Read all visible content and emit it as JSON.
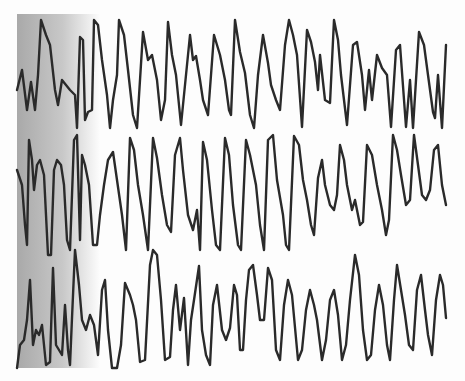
{
  "chart_data": {
    "type": "line",
    "title": "",
    "xlabel": "",
    "ylabel": "",
    "grid": false,
    "legend": "none",
    "shading": {
      "x_start": 17,
      "x_end": 100,
      "color_dark": "#a9a9a9",
      "color_light": "#fdfdfd"
    },
    "trace_color": "#2a2a2a",
    "series": [
      {
        "name": "trace-1",
        "points": [
          [
            17,
            90
          ],
          [
            22,
            70
          ],
          [
            27,
            110
          ],
          [
            31,
            82
          ],
          [
            35,
            110
          ],
          [
            38,
            75
          ],
          [
            41,
            20
          ],
          [
            46,
            35
          ],
          [
            50,
            45
          ],
          [
            55,
            90
          ],
          [
            58,
            105
          ],
          [
            62,
            80
          ],
          [
            66,
            85
          ],
          [
            70,
            90
          ],
          [
            75,
            95
          ],
          [
            77,
            128
          ],
          [
            80,
            37
          ],
          [
            83,
            40
          ],
          [
            85,
            120
          ],
          [
            88,
            112
          ],
          [
            92,
            110
          ],
          [
            94,
            20
          ],
          [
            98,
            25
          ],
          [
            102,
            60
          ],
          [
            107,
            95
          ],
          [
            110,
            128
          ],
          [
            113,
            100
          ],
          [
            117,
            75
          ],
          [
            119,
            20
          ],
          [
            124,
            35
          ],
          [
            128,
            70
          ],
          [
            133,
            115
          ],
          [
            137,
            128
          ],
          [
            143,
            32
          ],
          [
            148,
            60
          ],
          [
            152,
            55
          ],
          [
            157,
            80
          ],
          [
            161,
            120
          ],
          [
            165,
            100
          ],
          [
            168,
            22
          ],
          [
            172,
            55
          ],
          [
            176,
            75
          ],
          [
            181,
            125
          ],
          [
            184,
            95
          ],
          [
            190,
            35
          ],
          [
            193,
            60
          ],
          [
            196,
            56
          ],
          [
            200,
            80
          ],
          [
            203,
            100
          ],
          [
            208,
            115
          ],
          [
            214,
            35
          ],
          [
            220,
            55
          ],
          [
            225,
            80
          ],
          [
            229,
            110
          ],
          [
            231,
            115
          ],
          [
            235,
            20
          ],
          [
            240,
            52
          ],
          [
            245,
            73
          ],
          [
            250,
            115
          ],
          [
            254,
            128
          ],
          [
            258,
            75
          ],
          [
            263,
            35
          ],
          [
            268,
            63
          ],
          [
            271,
            85
          ],
          [
            276,
            100
          ],
          [
            280,
            110
          ],
          [
            285,
            45
          ],
          [
            289,
            20
          ],
          [
            293,
            35
          ],
          [
            297,
            55
          ],
          [
            302,
            127
          ],
          [
            307,
            30
          ],
          [
            311,
            42
          ],
          [
            315,
            62
          ],
          [
            318,
            90
          ],
          [
            320,
            55
          ],
          [
            325,
            100
          ],
          [
            330,
            103
          ],
          [
            334,
            20
          ],
          [
            338,
            40
          ],
          [
            341,
            75
          ],
          [
            344,
            100
          ],
          [
            347,
            125
          ],
          [
            353,
            45
          ],
          [
            357,
            42
          ],
          [
            362,
            75
          ],
          [
            365,
            110
          ],
          [
            369,
            70
          ],
          [
            372,
            100
          ],
          [
            377,
            55
          ],
          [
            382,
            68
          ],
          [
            387,
            75
          ],
          [
            391,
            127
          ],
          [
            396,
            50
          ],
          [
            400,
            45
          ],
          [
            406,
            127
          ],
          [
            410,
            80
          ],
          [
            413,
            128
          ],
          [
            419,
            32
          ],
          [
            424,
            45
          ],
          [
            428,
            75
          ],
          [
            433,
            112
          ],
          [
            435,
            118
          ],
          [
            438,
            75
          ],
          [
            442,
            128
          ],
          [
            446,
            45
          ]
        ]
      },
      {
        "name": "trace-2",
        "points": [
          [
            17,
            170
          ],
          [
            22,
            185
          ],
          [
            25,
            225
          ],
          [
            27,
            245
          ],
          [
            29,
            140
          ],
          [
            32,
            160
          ],
          [
            34,
            190
          ],
          [
            37,
            165
          ],
          [
            40,
            160
          ],
          [
            44,
            175
          ],
          [
            48,
            255
          ],
          [
            51,
            255
          ],
          [
            54,
            170
          ],
          [
            57,
            160
          ],
          [
            61,
            165
          ],
          [
            64,
            185
          ],
          [
            67,
            240
          ],
          [
            70,
            250
          ],
          [
            74,
            140
          ],
          [
            77,
            135
          ],
          [
            80,
            240
          ],
          [
            82,
            155
          ],
          [
            85,
            165
          ],
          [
            89,
            185
          ],
          [
            93,
            245
          ],
          [
            97,
            245
          ],
          [
            100,
            215
          ],
          [
            104,
            185
          ],
          [
            108,
            160
          ],
          [
            113,
            152
          ],
          [
            117,
            180
          ],
          [
            122,
            215
          ],
          [
            126,
            250
          ],
          [
            130,
            138
          ],
          [
            134,
            150
          ],
          [
            138,
            185
          ],
          [
            143,
            215
          ],
          [
            148,
            250
          ],
          [
            153,
            138
          ],
          [
            157,
            158
          ],
          [
            162,
            195
          ],
          [
            167,
            225
          ],
          [
            171,
            232
          ],
          [
            175,
            155
          ],
          [
            180,
            138
          ],
          [
            183,
            170
          ],
          [
            188,
            215
          ],
          [
            193,
            230
          ],
          [
            197,
            210
          ],
          [
            200,
            250
          ],
          [
            203,
            142
          ],
          [
            207,
            160
          ],
          [
            212,
            210
          ],
          [
            216,
            245
          ],
          [
            220,
            250
          ],
          [
            225,
            138
          ],
          [
            229,
            155
          ],
          [
            233,
            205
          ],
          [
            238,
            245
          ],
          [
            241,
            250
          ],
          [
            246,
            140
          ],
          [
            250,
            155
          ],
          [
            256,
            185
          ],
          [
            260,
            225
          ],
          [
            264,
            250
          ],
          [
            268,
            140
          ],
          [
            273,
            135
          ],
          [
            277,
            180
          ],
          [
            283,
            215
          ],
          [
            286,
            245
          ],
          [
            289,
            250
          ],
          [
            294,
            136
          ],
          [
            299,
            145
          ],
          [
            303,
            180
          ],
          [
            307,
            200
          ],
          [
            311,
            225
          ],
          [
            314,
            235
          ],
          [
            318,
            178
          ],
          [
            322,
            160
          ],
          [
            325,
            185
          ],
          [
            330,
            205
          ],
          [
            334,
            210
          ],
          [
            337,
            195
          ],
          [
            340,
            145
          ],
          [
            344,
            160
          ],
          [
            347,
            185
          ],
          [
            352,
            210
          ],
          [
            355,
            200
          ],
          [
            360,
            225
          ],
          [
            363,
            222
          ],
          [
            367,
            145
          ],
          [
            372,
            155
          ],
          [
            377,
            185
          ],
          [
            382,
            210
          ],
          [
            386,
            235
          ],
          [
            389,
            220
          ],
          [
            393,
            135
          ],
          [
            397,
            150
          ],
          [
            401,
            175
          ],
          [
            406,
            205
          ],
          [
            410,
            200
          ],
          [
            414,
            135
          ],
          [
            418,
            165
          ],
          [
            422,
            195
          ],
          [
            426,
            200
          ],
          [
            430,
            190
          ],
          [
            434,
            150
          ],
          [
            438,
            145
          ],
          [
            442,
            185
          ],
          [
            446,
            205
          ]
        ]
      },
      {
        "name": "trace-3",
        "points": [
          [
            17,
            368
          ],
          [
            20,
            345
          ],
          [
            24,
            340
          ],
          [
            27,
            320
          ],
          [
            30,
            280
          ],
          [
            33,
            345
          ],
          [
            36,
            330
          ],
          [
            39,
            335
          ],
          [
            42,
            325
          ],
          [
            46,
            365
          ],
          [
            50,
            362
          ],
          [
            53,
            268
          ],
          [
            56,
            345
          ],
          [
            59,
            350
          ],
          [
            62,
            355
          ],
          [
            65,
            305
          ],
          [
            68,
            350
          ],
          [
            70,
            365
          ],
          [
            72,
            318
          ],
          [
            75,
            250
          ],
          [
            79,
            285
          ],
          [
            82,
            320
          ],
          [
            86,
            330
          ],
          [
            90,
            315
          ],
          [
            94,
            325
          ],
          [
            98,
            355
          ],
          [
            102,
            290
          ],
          [
            105,
            280
          ],
          [
            108,
            330
          ],
          [
            112,
            368
          ],
          [
            117,
            368
          ],
          [
            121,
            345
          ],
          [
            125,
            283
          ],
          [
            130,
            295
          ],
          [
            133,
            305
          ],
          [
            136,
            320
          ],
          [
            140,
            362
          ],
          [
            145,
            360
          ],
          [
            150,
            265
          ],
          [
            153,
            250
          ],
          [
            157,
            255
          ],
          [
            161,
            300
          ],
          [
            165,
            360
          ],
          [
            170,
            357
          ],
          [
            173,
            310
          ],
          [
            176,
            285
          ],
          [
            180,
            330
          ],
          [
            184,
            298
          ],
          [
            188,
            365
          ],
          [
            191,
            320
          ],
          [
            194,
            300
          ],
          [
            199,
            266
          ],
          [
            202,
            330
          ],
          [
            206,
            355
          ],
          [
            210,
            365
          ],
          [
            213,
            305
          ],
          [
            217,
            285
          ],
          [
            222,
            330
          ],
          [
            226,
            340
          ],
          [
            230,
            328
          ],
          [
            234,
            285
          ],
          [
            237,
            295
          ],
          [
            240,
            350
          ],
          [
            243,
            350
          ],
          [
            246,
            300
          ],
          [
            249,
            270
          ],
          [
            253,
            265
          ],
          [
            257,
            295
          ],
          [
            260,
            320
          ],
          [
            264,
            320
          ],
          [
            268,
            268
          ],
          [
            272,
            280
          ],
          [
            276,
            350
          ],
          [
            280,
            360
          ],
          [
            284,
            305
          ],
          [
            288,
            280
          ],
          [
            292,
            295
          ],
          [
            298,
            360
          ],
          [
            302,
            350
          ],
          [
            306,
            310
          ],
          [
            310,
            290
          ],
          [
            314,
            305
          ],
          [
            317,
            320
          ],
          [
            322,
            360
          ],
          [
            326,
            340
          ],
          [
            330,
            300
          ],
          [
            334,
            290
          ],
          [
            338,
            315
          ],
          [
            342,
            360
          ],
          [
            346,
            345
          ],
          [
            350,
            300
          ],
          [
            355,
            255
          ],
          [
            359,
            275
          ],
          [
            363,
            330
          ],
          [
            367,
            360
          ],
          [
            371,
            355
          ],
          [
            375,
            310
          ],
          [
            379,
            285
          ],
          [
            383,
            305
          ],
          [
            387,
            345
          ],
          [
            390,
            360
          ],
          [
            394,
            300
          ],
          [
            397,
            265
          ],
          [
            401,
            290
          ],
          [
            405,
            315
          ],
          [
            409,
            345
          ],
          [
            413,
            350
          ],
          [
            417,
            290
          ],
          [
            421,
            275
          ],
          [
            425,
            310
          ],
          [
            428,
            335
          ],
          [
            432,
            355
          ],
          [
            436,
            300
          ],
          [
            440,
            275
          ],
          [
            443,
            285
          ],
          [
            446,
            318
          ]
        ]
      }
    ]
  },
  "figure": {
    "caption": ""
  }
}
